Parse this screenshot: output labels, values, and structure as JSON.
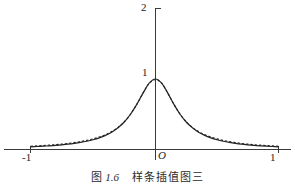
{
  "figure": {
    "caption_prefix": "图",
    "caption_number": "1.6",
    "caption_text": "样条插值图三",
    "background_color": "#ffffff",
    "ink_color": "#242424"
  },
  "labels": {
    "y_top": "2",
    "y_one": "1",
    "origin": "O",
    "x_neg_one": "-1",
    "x_pos_one": "1"
  },
  "chart_data": {
    "type": "line",
    "title": "",
    "subtitle": "",
    "xlabel": "",
    "ylabel": "",
    "xlim": [
      -1.15,
      1.15
    ],
    "ylim": [
      0,
      2
    ],
    "grid": false,
    "legend": "none",
    "axes": {
      "x_axis_drawn": true,
      "y_axis_drawn": true,
      "x_ticks": [
        -1,
        0,
        1
      ],
      "x_tick_labels": [
        "-1",
        "O",
        "1"
      ],
      "y_ticks": [
        1,
        2
      ],
      "y_tick_labels": [
        "1",
        "2"
      ],
      "origin_label": "O",
      "y_axis_top_value": 2
    },
    "annotations": [
      {
        "text": "1",
        "x": -0.06,
        "y": 1.02,
        "note": "peak height marker on y-axis"
      },
      {
        "text": "2",
        "x": -0.07,
        "y": 1.97,
        "note": "y-axis top tick"
      }
    ],
    "x": [
      -1.0,
      -0.95,
      -0.9,
      -0.85,
      -0.8,
      -0.75,
      -0.7,
      -0.65,
      -0.6,
      -0.55,
      -0.5,
      -0.45,
      -0.4,
      -0.35,
      -0.3,
      -0.25,
      -0.2,
      -0.15,
      -0.1,
      -0.05,
      0.0,
      0.05,
      0.1,
      0.15,
      0.2,
      0.25,
      0.3,
      0.35,
      0.4,
      0.45,
      0.5,
      0.55,
      0.6,
      0.65,
      0.7,
      0.75,
      0.8,
      0.85,
      0.9,
      0.95,
      1.0
    ],
    "series": [
      {
        "name": "f(x) = 1/(1+25x^2)",
        "style": "solid",
        "color": "#242424",
        "values": [
          0.0385,
          0.0424,
          0.047,
          0.0525,
          0.0588,
          0.0664,
          0.0754,
          0.0864,
          0.1,
          0.1169,
          0.1379,
          0.1649,
          0.2,
          0.2462,
          0.3077,
          0.3902,
          0.5,
          0.64,
          0.8,
          0.9412,
          1.0,
          0.9412,
          0.8,
          0.64,
          0.5,
          0.3902,
          0.3077,
          0.2462,
          0.2,
          0.1649,
          0.1379,
          0.1169,
          0.1,
          0.0864,
          0.0754,
          0.0664,
          0.0588,
          0.0525,
          0.047,
          0.0424,
          0.0385
        ]
      },
      {
        "name": "cubic spline interpolant S(x)",
        "style": "dashed",
        "color": "#242424",
        "values": [
          0.0462,
          0.0508,
          0.0556,
          0.0612,
          0.068,
          0.0762,
          0.086,
          0.0976,
          0.1118,
          0.1292,
          0.1506,
          0.1772,
          0.2106,
          0.2542,
          0.3124,
          0.3918,
          0.5,
          0.6388,
          0.7992,
          0.9404,
          0.99,
          0.9404,
          0.7992,
          0.6388,
          0.5,
          0.3918,
          0.3124,
          0.2542,
          0.2106,
          0.1772,
          0.1506,
          0.1292,
          0.1118,
          0.0976,
          0.086,
          0.0762,
          0.068,
          0.0612,
          0.0556,
          0.0508,
          0.0462
        ]
      }
    ]
  }
}
